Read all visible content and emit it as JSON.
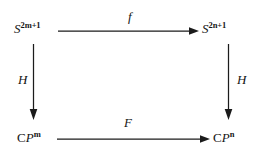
{
  "diagram": {
    "kind": "commutative-square",
    "nodes": {
      "top_left": {
        "base": "S",
        "sup": "2m+1",
        "full": "S^{2m+1}",
        "base_style": "italic"
      },
      "top_right": {
        "base": "S",
        "sup": "2n+1",
        "full": "S^{2n+1}",
        "base_style": "italic"
      },
      "bottom_left": {
        "base_c": "C",
        "base_p": "P",
        "sup": "m",
        "full": "CP^m",
        "base_style": "mixed"
      },
      "bottom_right": {
        "base_c": "C",
        "base_p": "P",
        "sup": "n",
        "full": "CP^n",
        "base_style": "mixed"
      }
    },
    "arrows": {
      "top": {
        "label": "f",
        "direction": "right",
        "from": "top_left",
        "to": "top_right"
      },
      "bottom": {
        "label": "F",
        "direction": "right",
        "from": "bottom_left",
        "to": "bottom_right"
      },
      "left": {
        "label": "H",
        "direction": "down",
        "from": "top_left",
        "to": "bottom_left"
      },
      "right": {
        "label": "H",
        "direction": "down",
        "from": "top_right",
        "to": "bottom_right"
      }
    },
    "colors": {
      "background": "#ffffff",
      "ink": "#1b1b1b",
      "text": "#151515"
    }
  }
}
